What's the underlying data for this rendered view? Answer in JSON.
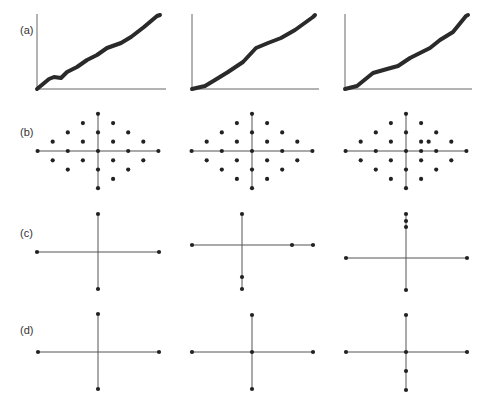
{
  "figure": {
    "row_labels": [
      {
        "id": "a",
        "text": "(a)",
        "x": 20,
        "y": 25
      },
      {
        "id": "b",
        "text": "(b)",
        "x": 20,
        "y": 127
      },
      {
        "id": "c",
        "text": "(c)",
        "x": 20,
        "y": 228
      },
      {
        "id": "d",
        "text": "(d)",
        "x": 20,
        "y": 325
      }
    ],
    "colors": {
      "line": "#555555",
      "dot": "#222222",
      "curve": "#2a2a2a",
      "axis": "#666666"
    },
    "rows": {
      "a": {
        "type": "line-curves",
        "panels": [
          {
            "axis": {
              "x0": 37,
              "y_top": 14,
              "y_base": 89,
              "x_end": 166
            },
            "curve": [
              [
                37,
                89
              ],
              [
                49,
                79
              ],
              [
                54,
                77
              ],
              [
                61,
                78
              ],
              [
                67,
                72
              ],
              [
                77,
                67
              ],
              [
                87,
                60
              ],
              [
                97,
                55
              ],
              [
                107,
                48
              ],
              [
                121,
                43
              ],
              [
                131,
                37
              ],
              [
                144,
                27
              ],
              [
                157,
                16
              ],
              [
                160,
                15
              ]
            ]
          },
          {
            "axis": {
              "x0": 192,
              "y_top": 14,
              "y_base": 89,
              "x_end": 319
            },
            "curve": [
              [
                192,
                89
              ],
              [
                205,
                86
              ],
              [
                215,
                80
              ],
              [
                228,
                72
              ],
              [
                243,
                62
              ],
              [
                256,
                48
              ],
              [
                268,
                43
              ],
              [
                281,
                38
              ],
              [
                295,
                30
              ],
              [
                313,
                17
              ],
              [
                315,
                15
              ]
            ]
          },
          {
            "axis": {
              "x0": 345,
              "y_top": 14,
              "y_base": 89,
              "x_end": 472
            },
            "curve": [
              [
                345,
                89
              ],
              [
                357,
                86
              ],
              [
                373,
                73
              ],
              [
                387,
                69
              ],
              [
                398,
                66
              ],
              [
                410,
                58
              ],
              [
                422,
                52
              ],
              [
                430,
                48
              ],
              [
                440,
                40
              ],
              [
                453,
                32
              ],
              [
                466,
                16
              ],
              [
                468,
                15
              ]
            ]
          }
        ]
      },
      "b": {
        "type": "lattice-diamond",
        "unit_x": 15.1,
        "unit_y": 9.3,
        "panels": [
          {
            "center": [
              98,
              151
            ],
            "points": [
              [
                0,
                4
              ],
              [
                -1,
                3
              ],
              [
                1,
                3
              ],
              [
                -2,
                2
              ],
              [
                0,
                2
              ],
              [
                2,
                2
              ],
              [
                -3,
                1
              ],
              [
                -1,
                1
              ],
              [
                1,
                1
              ],
              [
                3,
                1
              ],
              [
                -4,
                0
              ],
              [
                -2,
                0
              ],
              [
                0,
                0
              ],
              [
                2,
                0
              ],
              [
                4,
                0
              ],
              [
                -3,
                -1
              ],
              [
                -1,
                -1
              ],
              [
                1,
                -1
              ],
              [
                3,
                -1
              ],
              [
                -2,
                -2
              ],
              [
                0,
                -2
              ],
              [
                2,
                -2
              ],
              [
                1,
                -3
              ],
              [
                0,
                -4
              ]
            ]
          },
          {
            "center": [
              252,
              151
            ],
            "points": [
              [
                0,
                4
              ],
              [
                -1,
                3
              ],
              [
                1,
                3
              ],
              [
                -2,
                2
              ],
              [
                0,
                2
              ],
              [
                2,
                2
              ],
              [
                -3,
                1
              ],
              [
                -1,
                1
              ],
              [
                1,
                1
              ],
              [
                3,
                1
              ],
              [
                -4,
                0
              ],
              [
                -2,
                0
              ],
              [
                0,
                0
              ],
              [
                2,
                0
              ],
              [
                4,
                0
              ],
              [
                -3,
                -1
              ],
              [
                -1,
                -1
              ],
              [
                1,
                -1
              ],
              [
                3,
                -1
              ],
              [
                -2,
                -2
              ],
              [
                0,
                -2
              ],
              [
                2,
                -2
              ],
              [
                -1,
                -3
              ],
              [
                1,
                -3
              ],
              [
                0,
                -4
              ]
            ]
          },
          {
            "center": [
              406,
              151
            ],
            "points": [
              [
                0,
                4
              ],
              [
                -1,
                3
              ],
              [
                1,
                3
              ],
              [
                -2,
                2
              ],
              [
                0,
                2
              ],
              [
                2,
                2
              ],
              [
                -3,
                1
              ],
              [
                -1,
                1
              ],
              [
                1,
                1
              ],
              [
                1.5,
                1
              ],
              [
                3,
                1
              ],
              [
                -4,
                0
              ],
              [
                -2,
                0
              ],
              [
                0,
                0
              ],
              [
                1,
                0
              ],
              [
                2,
                0
              ],
              [
                4,
                0
              ],
              [
                -3,
                -1
              ],
              [
                -1,
                -1
              ],
              [
                1,
                -1
              ],
              [
                3,
                -1
              ],
              [
                -2,
                -2
              ],
              [
                0,
                -2
              ],
              [
                2,
                -2
              ],
              [
                -1,
                -3
              ],
              [
                1,
                -3
              ],
              [
                0,
                -4
              ]
            ]
          }
        ]
      },
      "c": {
        "type": "cross",
        "panels": [
          {
            "h": {
              "y": 252,
              "x1": 37,
              "x2": 159
            },
            "v": {
              "x": 98,
              "y1": 214,
              "y2": 289
            },
            "dots": [
              [
                98,
                214
              ],
              [
                37,
                252
              ],
              [
                159,
                252
              ],
              [
                98,
                289
              ]
            ]
          },
          {
            "h": {
              "y": 245,
              "x1": 192,
              "x2": 313
            },
            "v": {
              "x": 242,
              "y1": 214,
              "y2": 289
            },
            "dots": [
              [
                242,
                214
              ],
              [
                192,
                245
              ],
              [
                292,
                245
              ],
              [
                313,
                245
              ],
              [
                242,
                277
              ],
              [
                242,
                289
              ]
            ]
          },
          {
            "h": {
              "y": 258,
              "x1": 346,
              "x2": 467
            },
            "v": {
              "x": 406,
              "y1": 214,
              "y2": 290
            },
            "dots": [
              [
                406,
                214
              ],
              [
                406,
                221
              ],
              [
                406,
                227
              ],
              [
                346,
                258
              ],
              [
                467,
                258
              ],
              [
                406,
                290
              ]
            ]
          }
        ]
      },
      "d": {
        "type": "cross",
        "panels": [
          {
            "h": {
              "y": 352,
              "x1": 38,
              "x2": 159
            },
            "v": {
              "x": 98,
              "y1": 314,
              "y2": 389
            },
            "dots": [
              [
                98,
                314
              ],
              [
                38,
                352
              ],
              [
                159,
                352
              ],
              [
                98,
                389
              ]
            ]
          },
          {
            "h": {
              "y": 352,
              "x1": 192,
              "x2": 313
            },
            "v": {
              "x": 252,
              "y1": 315,
              "y2": 389
            },
            "dots": [
              [
                252,
                315
              ],
              [
                192,
                352
              ],
              [
                252,
                352
              ],
              [
                313,
                352
              ],
              [
                252,
                389
              ]
            ]
          },
          {
            "h": {
              "y": 352,
              "x1": 346,
              "x2": 467
            },
            "v": {
              "x": 406,
              "y1": 315,
              "y2": 390
            },
            "dots": [
              [
                406,
                315
              ],
              [
                346,
                352
              ],
              [
                406,
                352
              ],
              [
                467,
                352
              ],
              [
                406,
                371
              ],
              [
                406,
                390
              ]
            ]
          }
        ]
      }
    }
  }
}
